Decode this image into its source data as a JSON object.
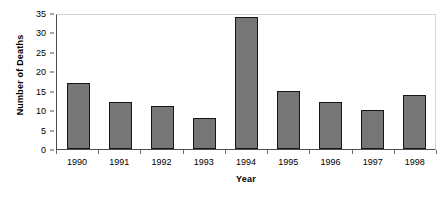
{
  "chart_data": {
    "type": "bar",
    "title": "",
    "xlabel": "Year",
    "ylabel": "Number of Deaths",
    "categories": [
      "1990",
      "1991",
      "1992",
      "1993",
      "1994",
      "1995",
      "1996",
      "1997",
      "1998"
    ],
    "values": [
      17,
      12,
      11,
      8,
      34,
      15,
      12,
      10,
      14
    ],
    "ylim": [
      0,
      35
    ],
    "yticks": [
      0,
      5,
      10,
      15,
      20,
      25,
      30,
      35
    ],
    "ytick_labels": [
      "0",
      "5",
      "10",
      "15",
      "20",
      "25",
      "30",
      "35"
    ],
    "grid": false,
    "legend": false,
    "bar_color": "#767676",
    "bar_border_color": "#161616",
    "axis_color": "#4d4d4d",
    "plot_border_color": "#d4d4d4",
    "background": "#ffffff"
  }
}
